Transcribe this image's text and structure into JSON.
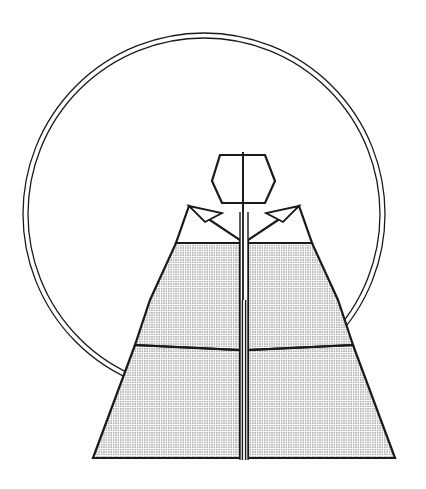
{
  "document": {
    "kind": "line-art-illustration",
    "subject": "hooded-robe-figure-with-halo-ring",
    "background_color": "#ffffff",
    "ink_color": "#1a1a1a",
    "width": 426,
    "height": 489
  },
  "palette": {
    "background": "#ffffff",
    "stroke": "#1a1a1a",
    "stroke_light": "#2b2b2b",
    "fill_white": "#ffffff",
    "stipple_dot": "#2a2a2a",
    "stipple_base": "#ffffff"
  },
  "strokes": {
    "ring_outer_width": 1.3,
    "ring_inner_width": 1.3,
    "body_outline_width": 2.2,
    "fold_line_width": 1.8,
    "placket_line_width": 1.4
  },
  "halo_ring": {
    "name": "halo-ring",
    "description": "large double-line circle behind the figure, occluded by the robe at lower left and lower right",
    "center_x": 204,
    "center_y": 214,
    "outer_radius": 181,
    "inner_radius": 176,
    "bounds": {
      "left": 23,
      "top": 33,
      "right": 385,
      "bottom": 395
    },
    "visible_arc_start_deg": 140,
    "visible_arc_end_deg": 42,
    "occluded_by": "robe-body"
  },
  "hood": {
    "name": "hood-head",
    "points": "220,155 265,155 275,181 265,203 222,203 212,181",
    "center_seam": {
      "x": 243,
      "y1": 152,
      "y2": 211
    },
    "fill": "#ffffff"
  },
  "collar": {
    "name": "collar-yoke",
    "left_panel": "189,206 222,206 222,243 176,243",
    "right_panel": "266,206 299,206 312,243 266,243",
    "left_notch": "189,206 222,213 205,222",
    "right_notch": "299,206 266,213 283,222"
  },
  "shoulders": {
    "name": "shoulder-panels",
    "left": "189,206 240,240 240,243 176,243",
    "right": "299,206 248,240 248,243 312,243",
    "fill": "#ffffff"
  },
  "torso": {
    "name": "torso-panels",
    "left": "176,243 240,243 240,350 135,345 150,300",
    "right": "312,243 248,243 248,350 353,345 338,300",
    "fill": "stipple"
  },
  "skirt": {
    "name": "skirt-panels",
    "left": "135,345 240,350 240,458 93,458",
    "right": "353,345 248,350 248,458 395,458",
    "fill": "stipple"
  },
  "placket": {
    "name": "center-placket",
    "x_center": 244,
    "top_y": 152,
    "bottom_y": 460,
    "width": 8,
    "fill": "#ffffff"
  },
  "stipple": {
    "name": "stipple-texture",
    "dot_spacing": 2.4,
    "dot_radius": 0.55,
    "opacity": 0.85
  },
  "labels": {
    "title": "",
    "caption": ""
  }
}
